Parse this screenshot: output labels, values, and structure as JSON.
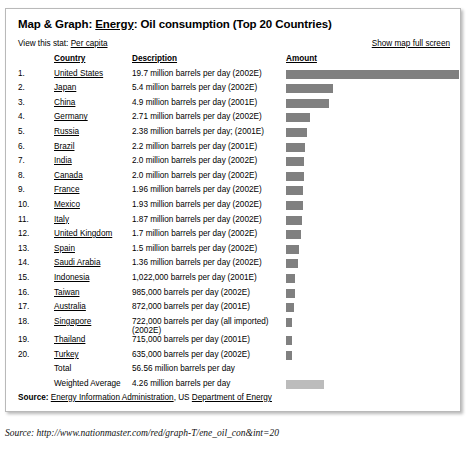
{
  "panel": {
    "title_prefix": "Map & Graph: ",
    "title_link": "Energy",
    "title_suffix": ": Oil consumption (Top 20 Countries)",
    "view_stat_label": "View this stat: ",
    "view_stat_link": "Per capita",
    "fullscreen_link": "Show map full screen"
  },
  "table": {
    "headers": {
      "rank": "",
      "country": "Country",
      "description": "Description",
      "amount": "Amount"
    },
    "rows": [
      {
        "rank": "1.",
        "country": "United States",
        "description": "19.7 million barrels per day (2002E)",
        "value": 19.7,
        "link": true
      },
      {
        "rank": "2.",
        "country": "Japan",
        "description": "5.4 million barrels per day (2002E)",
        "value": 5.4,
        "link": true
      },
      {
        "rank": "3.",
        "country": "China",
        "description": "4.9 million barrels per day (2001E)",
        "value": 4.9,
        "link": true
      },
      {
        "rank": "4.",
        "country": "Germany",
        "description": "2.71 million barrels per day (2002E)",
        "value": 2.71,
        "link": true
      },
      {
        "rank": "5.",
        "country": "Russia",
        "description": "2.38 million barrels per day; (2001E)",
        "value": 2.38,
        "link": true
      },
      {
        "rank": "6.",
        "country": "Brazil",
        "description": "2.2 million barrels per day (2001E)",
        "value": 2.2,
        "link": true
      },
      {
        "rank": "7.",
        "country": "India",
        "description": "2.0 million barrels per day (2002E)",
        "value": 2.0,
        "link": true
      },
      {
        "rank": "8.",
        "country": "Canada",
        "description": "2.0 million barrels per day (2002E)",
        "value": 2.0,
        "link": true
      },
      {
        "rank": "9.",
        "country": "France",
        "description": "1.96 million barrels per day (2002E)",
        "value": 1.96,
        "link": true
      },
      {
        "rank": "10.",
        "country": "Mexico",
        "description": "1.93 million barrels per day (2002E)",
        "value": 1.93,
        "link": true
      },
      {
        "rank": "11.",
        "country": "Italy",
        "description": "1.87 million barrels per day (2002E)",
        "value": 1.87,
        "link": true
      },
      {
        "rank": "12.",
        "country": "United Kingdom",
        "description": "1.7 million barrels per day (2002E)",
        "value": 1.7,
        "link": true
      },
      {
        "rank": "13.",
        "country": "Spain",
        "description": "1.5 million barrels per day (2002E)",
        "value": 1.5,
        "link": true
      },
      {
        "rank": "14.",
        "country": "Saudi Arabia",
        "description": "1.36 million barrels per day (2002E)",
        "value": 1.36,
        "link": true
      },
      {
        "rank": "15.",
        "country": "Indonesia",
        "description": "1,022,000 barrels per day (2001E)",
        "value": 1.022,
        "link": true
      },
      {
        "rank": "16.",
        "country": "Taiwan",
        "description": "985,000 barrels per day (2002E)",
        "value": 0.985,
        "link": true
      },
      {
        "rank": "17.",
        "country": "Australia",
        "description": "872,000 barrels per day (2001E)",
        "value": 0.872,
        "link": true
      },
      {
        "rank": "18.",
        "country": "Singapore",
        "description": "722,000 barrels per day (all imported) (2002E)",
        "value": 0.722,
        "link": true
      },
      {
        "rank": "19.",
        "country": "Thailand",
        "description": "715,000 barrels per day (2001E)",
        "value": 0.715,
        "link": true
      },
      {
        "rank": "20.",
        "country": "Turkey",
        "description": "635,000 barrels per day (2002E)",
        "value": 0.635,
        "link": true
      },
      {
        "rank": "",
        "country": "Total",
        "description": "56.56 million barrels per day",
        "value": null,
        "link": false
      },
      {
        "rank": "",
        "country": "Weighted Average",
        "description": "4.26 million barrels per day",
        "value": 4.26,
        "link": false,
        "light": true
      }
    ]
  },
  "source": {
    "label": "Source: ",
    "link1": "Energy Information Administration",
    "middle": ", US ",
    "link2": "Department of Energy"
  },
  "caption": "Source: http://www.nationmaster.com/red/graph-T/ene_oil_con&int=20",
  "chart_data": {
    "type": "bar",
    "title": "Map & Graph: Energy: Oil consumption (Top 20 Countries)",
    "xlabel": "",
    "ylabel": "Amount",
    "unit": "million barrels per day",
    "orientation": "horizontal",
    "grid": false,
    "legend": false,
    "xlim": [
      0,
      19.7
    ],
    "bar_color": "#808080",
    "average_bar_color": "#bcbcbc",
    "categories": [
      "United States",
      "Japan",
      "China",
      "Germany",
      "Russia",
      "Brazil",
      "India",
      "Canada",
      "France",
      "Mexico",
      "Italy",
      "United Kingdom",
      "Spain",
      "Saudi Arabia",
      "Indonesia",
      "Taiwan",
      "Australia",
      "Singapore",
      "Thailand",
      "Turkey"
    ],
    "values": [
      19.7,
      5.4,
      4.9,
      2.71,
      2.38,
      2.2,
      2.0,
      2.0,
      1.96,
      1.93,
      1.87,
      1.7,
      1.5,
      1.36,
      1.022,
      0.985,
      0.872,
      0.722,
      0.715,
      0.635
    ],
    "total": 56.56,
    "weighted_average": 4.26
  }
}
